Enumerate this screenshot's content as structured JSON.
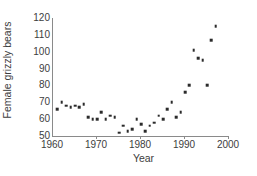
{
  "chart_data": {
    "type": "scatter",
    "title": "",
    "xlabel": "Year",
    "ylabel": "Female grizzly bears",
    "xlim": [
      1960,
      2000
    ],
    "ylim": [
      50,
      120
    ],
    "xticks": [
      1960,
      1970,
      1980,
      1990,
      2000
    ],
    "yticks": [
      50,
      60,
      70,
      80,
      90,
      100,
      110,
      120
    ],
    "grid": false,
    "legend": "none",
    "marker_color": "#2b2b2b",
    "axis_color": "#8a8a8a",
    "x": [
      1961,
      1962,
      1963,
      1964,
      1965,
      1966,
      1967,
      1968,
      1969,
      1970,
      1971,
      1972,
      1973,
      1974,
      1975,
      1976,
      1977,
      1978,
      1979,
      1980,
      1981,
      1982,
      1983,
      1984,
      1985,
      1986,
      1987,
      1988,
      1989,
      1990,
      1991,
      1992,
      1993,
      1994,
      1995,
      1996,
      1997
    ],
    "y": [
      66,
      70,
      68,
      67,
      68,
      67,
      69,
      61,
      60,
      60,
      64,
      60,
      62,
      61,
      52,
      56,
      53,
      54,
      60,
      57,
      53,
      56,
      58,
      62,
      60,
      66,
      70,
      61,
      64,
      76,
      80,
      101,
      96,
      95,
      80,
      107,
      115
    ],
    "series": [
      {
        "name": "Female grizzly bears",
        "points": [
          {
            "x": 1961,
            "y": 66
          },
          {
            "x": 1962,
            "y": 70
          },
          {
            "x": 1963,
            "y": 68
          },
          {
            "x": 1964,
            "y": 67
          },
          {
            "x": 1965,
            "y": 68
          },
          {
            "x": 1966,
            "y": 67
          },
          {
            "x": 1967,
            "y": 69
          },
          {
            "x": 1968,
            "y": 61
          },
          {
            "x": 1969,
            "y": 60
          },
          {
            "x": 1970,
            "y": 60
          },
          {
            "x": 1971,
            "y": 64
          },
          {
            "x": 1972,
            "y": 60
          },
          {
            "x": 1973,
            "y": 62
          },
          {
            "x": 1974,
            "y": 61
          },
          {
            "x": 1975,
            "y": 52
          },
          {
            "x": 1976,
            "y": 56
          },
          {
            "x": 1977,
            "y": 53
          },
          {
            "x": 1978,
            "y": 54
          },
          {
            "x": 1979,
            "y": 60
          },
          {
            "x": 1980,
            "y": 57
          },
          {
            "x": 1981,
            "y": 53
          },
          {
            "x": 1982,
            "y": 56
          },
          {
            "x": 1983,
            "y": 58
          },
          {
            "x": 1984,
            "y": 62
          },
          {
            "x": 1985,
            "y": 60
          },
          {
            "x": 1986,
            "y": 66
          },
          {
            "x": 1987,
            "y": 70
          },
          {
            "x": 1988,
            "y": 61
          },
          {
            "x": 1989,
            "y": 64
          },
          {
            "x": 1990,
            "y": 76
          },
          {
            "x": 1991,
            "y": 80
          },
          {
            "x": 1992,
            "y": 101
          },
          {
            "x": 1993,
            "y": 96
          },
          {
            "x": 1994,
            "y": 95
          },
          {
            "x": 1995,
            "y": 80
          },
          {
            "x": 1996,
            "y": 107
          },
          {
            "x": 1997,
            "y": 115
          }
        ]
      }
    ]
  }
}
